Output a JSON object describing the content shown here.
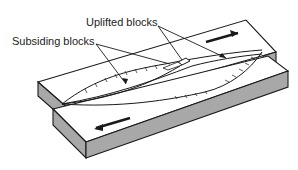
{
  "diagram": {
    "type": "strike-slip fault block diagram",
    "labels": {
      "uplifted": "Uplifted blocks",
      "subsiding": "Subsiding blocks"
    },
    "arrows": [
      {
        "block": "upper (back) block",
        "direction": "right"
      },
      {
        "block": "lower (front) block",
        "direction": "left"
      }
    ],
    "colors": {
      "line": "#1a1a1a",
      "block_top": "#ffffff",
      "block_side": "#a8a8a8"
    }
  }
}
